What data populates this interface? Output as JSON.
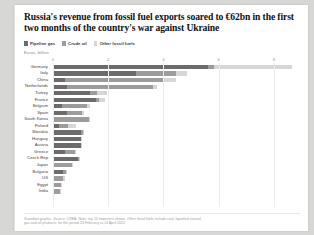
{
  "card": {
    "title": "Russia's revenue from fossil fuel exports soared to €62bn in the first two months of the country's war against Ukraine",
    "unit_label": "Euros, billion",
    "footnote_line1": "Guardian graphic. Source: CREA. Note: top 20 importers shown. Other fossil fuels include coal, liquefied natural",
    "footnote_line2": "gas and oil products, for the period 24 February to 24 April 2022"
  },
  "chart_data": {
    "type": "bar",
    "orientation": "horizontal",
    "stacked": true,
    "title": "Russia's revenue from fossil fuel exports soared to €62bn in the first two months of the country's war against Ukraine",
    "xlabel": "Euros, billion",
    "ylabel": "",
    "xlim": [
      0,
      9.2
    ],
    "xticks": [
      0,
      2,
      4,
      6,
      8
    ],
    "xtick_labels": [
      "0",
      "2",
      "4",
      "6",
      "8"
    ],
    "grid": true,
    "legend_position": "top-left",
    "colors": {
      "pipeline_gas": "#6b6b6b",
      "crude_oil": "#9c9c9c",
      "other_fossil_fuels": "#d6d6d6"
    },
    "series": [
      {
        "name": "Pipeline gas",
        "key": "pipeline_gas",
        "color": "#6b6b6b",
        "values": [
          5.6,
          3.0,
          0.45,
          0.52,
          1.35,
          1.55,
          0.33,
          0.5,
          0.0,
          0.2,
          1.02,
          1.0,
          1.0,
          0.45,
          0.92,
          0.0,
          0.35,
          0.0,
          0.0,
          0.0
        ]
      },
      {
        "name": "Crude oil",
        "key": "crude_oil",
        "color": "#9c9c9c",
        "values": [
          0.25,
          1.45,
          3.55,
          3.1,
          0.25,
          0.1,
          0.9,
          0.55,
          1.3,
          0.35,
          0.05,
          0.02,
          0.02,
          0.35,
          0.02,
          0.68,
          0.12,
          0.38,
          0.28,
          0.26
        ]
      },
      {
        "name": "Other fossil fuels",
        "key": "other_fossil_fuels",
        "color": "#d6d6d6",
        "values": [
          2.8,
          0.4,
          0.45,
          0.15,
          0.35,
          0.25,
          0.1,
          0.08,
          0.05,
          0.3,
          0.02,
          0.02,
          0.02,
          0.05,
          0.02,
          0.06,
          0.02,
          0.04,
          0.03,
          0.02
        ]
      }
    ],
    "categories": [
      "Germany",
      "Italy",
      "China",
      "Netherlands",
      "Turkey",
      "France",
      "Belgium",
      "Spain",
      "South Korea",
      "Poland",
      "Slovakia",
      "Hungary",
      "Austria",
      "Greece",
      "Czech Rep",
      "Japan",
      "Bulgaria",
      "US",
      "Egypt",
      "India"
    ],
    "totals": [
      8.65,
      4.85,
      4.45,
      3.77,
      1.95,
      1.9,
      1.33,
      1.13,
      1.35,
      0.85,
      1.09,
      1.04,
      1.04,
      0.85,
      0.96,
      0.74,
      0.49,
      0.42,
      0.31,
      0.28
    ]
  }
}
